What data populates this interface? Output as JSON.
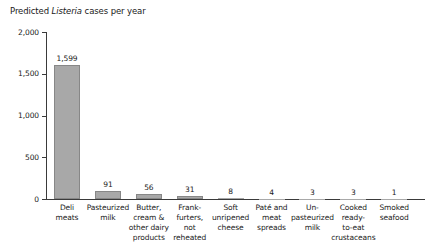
{
  "title": {
    "prefix": "Predicted ",
    "italic": "Listeria",
    "suffix": " cases per year"
  },
  "chart_data": {
    "type": "bar",
    "title": "Predicted Listeria cases per year",
    "xlabel": "",
    "ylabel": "",
    "categories": [
      "Deli meats",
      "Pasteurized milk",
      "Butter, cream & other dairy products",
      "Frank-furters, not reheated",
      "Soft unripened cheese",
      "Paté and meat spreads",
      "Un-pasteurized milk",
      "Cooked ready-to-eat crustaceans",
      "Smoked seafood"
    ],
    "category_lines": [
      [
        "Deli",
        "meats"
      ],
      [
        "Pasteurized",
        "milk"
      ],
      [
        "Butter,",
        "cream &",
        "other dairy",
        "products"
      ],
      [
        "Frank-",
        "furters,",
        "not",
        "reheated"
      ],
      [
        "Soft",
        "unripened",
        "cheese"
      ],
      [
        "Paté and",
        "meat",
        "spreads"
      ],
      [
        "Un-",
        "pasteurized",
        "milk"
      ],
      [
        "Cooked",
        "ready-",
        "to-eat",
        "crustaceans"
      ],
      [
        "Smoked",
        "seafood"
      ]
    ],
    "values": [
      1599,
      91,
      56,
      31,
      8,
      4,
      3,
      3,
      1
    ],
    "value_labels": [
      "1,599",
      "91",
      "56",
      "31",
      "8",
      "4",
      "3",
      "3",
      "1"
    ],
    "ylim": [
      0,
      2000
    ],
    "yticks": [
      0,
      500,
      1000,
      1500,
      2000
    ],
    "ytick_labels": [
      "0",
      "500",
      "1,000",
      "1,500",
      "2,000"
    ],
    "grid": false,
    "legend": "none",
    "bar_color": "#a8a8a8",
    "bar_border_color": "#878787",
    "axis_color": "#3a3a3a",
    "text_color": "#1a1a1a"
  }
}
